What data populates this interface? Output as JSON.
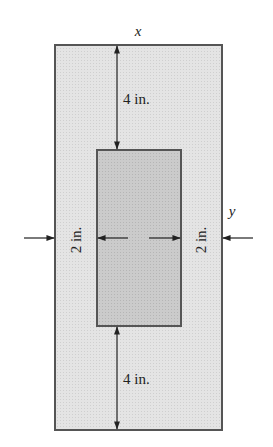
{
  "figure": {
    "axis_x_label": "x",
    "axis_y_label": "y",
    "top_dimension": "4 in.",
    "bottom_dimension": "4 in.",
    "left_dimension": "2 in.",
    "right_dimension": "2 in.",
    "colors": {
      "outer_fill": "#e3e3e3",
      "inner_fill": "#c9c9c9",
      "stroke": "#555555",
      "arrow": "#222222"
    }
  }
}
